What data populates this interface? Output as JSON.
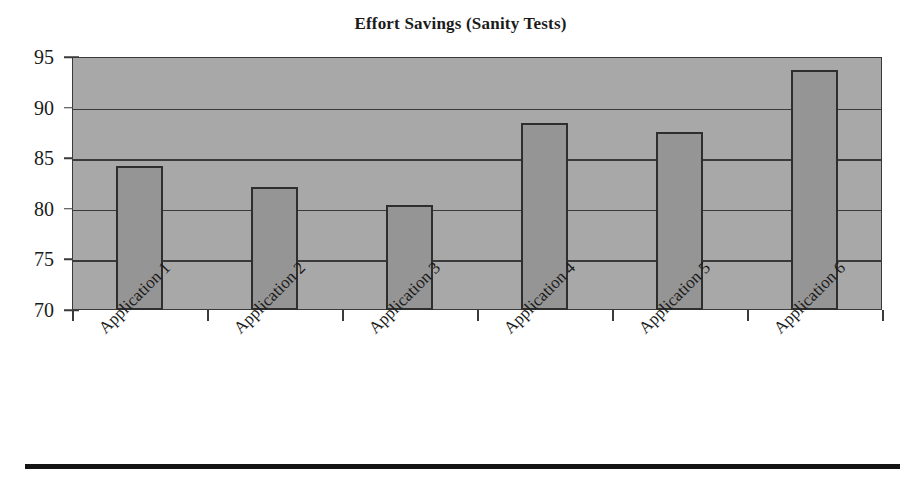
{
  "chart_data": {
    "type": "bar",
    "title": "Effort Savings (Sanity Tests)",
    "xlabel": "",
    "ylabel": "",
    "categories": [
      "Application 1",
      "Application 2",
      "Application 3",
      "Application 4",
      "Application 5",
      "Application 6"
    ],
    "values": [
      84.2,
      82.2,
      80.4,
      88.5,
      87.6,
      93.7
    ],
    "ylim": [
      70,
      95
    ],
    "yticks": [
      70,
      75,
      80,
      85,
      90,
      95
    ],
    "ytick_labels": [
      "70",
      "75",
      "80",
      "85",
      "90",
      "95"
    ],
    "grid": true,
    "legend": false,
    "series": [
      {
        "name": "Effort Savings",
        "values": [
          84.2,
          82.2,
          80.4,
          88.5,
          87.6,
          93.7
        ]
      }
    ],
    "colors": {
      "bar_fill": "#959595",
      "bar_border": "#2e2e2e",
      "plot_background": "#a8a8a8",
      "gridline": "#3a3a3a",
      "text": "#1b1b1b",
      "rule": "#141414"
    }
  }
}
